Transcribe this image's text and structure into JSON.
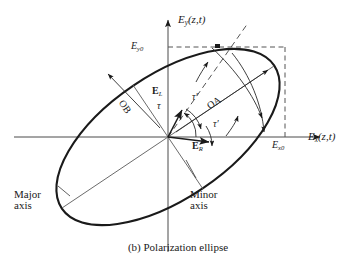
{
  "figure": {
    "caption": "(b) Polarization ellipse",
    "axes": {
      "y_label_main": "E",
      "y_label_sub": "y",
      "y_label_arg": "(z,t)",
      "x_label_main": "E",
      "x_label_sub": "x",
      "x_label_arg": "(z,t)"
    },
    "amplitudes": {
      "y_peak_main": "E",
      "y_peak_sub": "y0",
      "x_peak_main": "E",
      "x_peak_sub": "x0"
    },
    "vectors": {
      "left_main": "E",
      "left_sub": "L",
      "right_main": "E",
      "right_sub": "R"
    },
    "semi_axes": {
      "major_label": "OA",
      "minor_label": "OB"
    },
    "angles": {
      "tau": "τ",
      "tau_prime_upper": "τ′",
      "tau_prime_lower": "τ′"
    },
    "axis_callouts": {
      "major_line1": "Major",
      "major_line2": "axis",
      "minor_line1": "Minor",
      "minor_line2": "axis"
    },
    "colors": {
      "ink": "#1a1a1a",
      "thin": "#4a4a4a",
      "dashed": "#555555"
    }
  }
}
